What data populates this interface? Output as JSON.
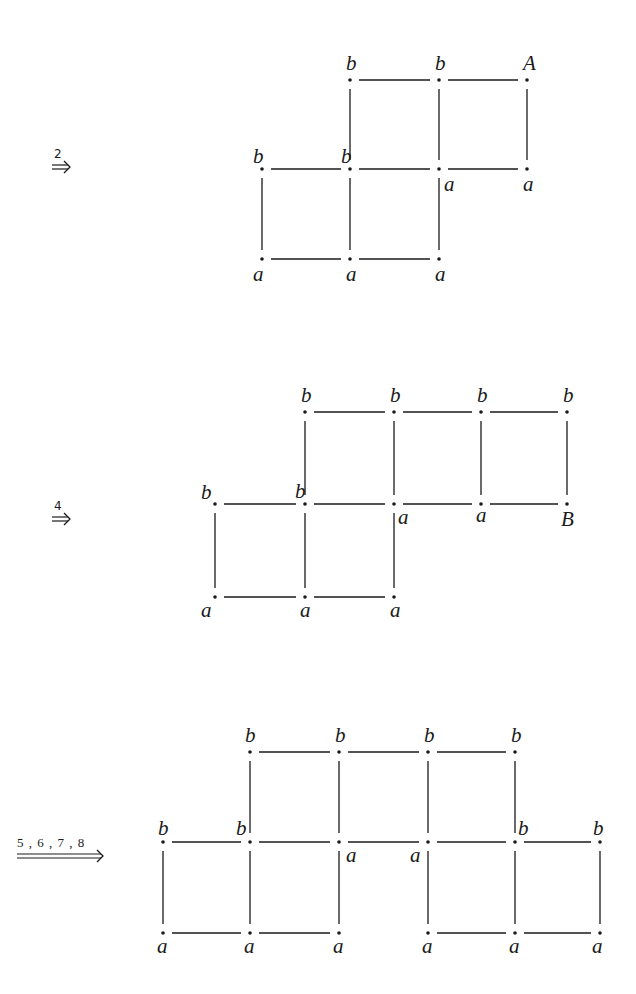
{
  "figures": [
    {
      "id": "step-2",
      "arrow": {
        "label": "2",
        "type": "double",
        "x": 52,
        "y": 167,
        "len": 18
      },
      "nodes": [
        {
          "id": "n1",
          "x": 350,
          "y": 80,
          "label": "b",
          "lx": -4,
          "ly": -10
        },
        {
          "id": "n2",
          "x": 439,
          "y": 80,
          "label": "b",
          "lx": -4,
          "ly": -10
        },
        {
          "id": "n3",
          "x": 527,
          "y": 80,
          "label": "A",
          "lx": -4,
          "ly": -10
        },
        {
          "id": "n4",
          "x": 262,
          "y": 169,
          "label": "b",
          "lx": -9,
          "ly": -6
        },
        {
          "id": "n5",
          "x": 350,
          "y": 169,
          "label": "b",
          "lx": -9,
          "ly": -6
        },
        {
          "id": "n6",
          "x": 439,
          "y": 169,
          "label": "a",
          "lx": 5,
          "ly": 22
        },
        {
          "id": "n7",
          "x": 527,
          "y": 169,
          "label": "a",
          "lx": -4,
          "ly": 22
        },
        {
          "id": "n8",
          "x": 262,
          "y": 259,
          "label": "a",
          "lx": -9,
          "ly": 22
        },
        {
          "id": "n9",
          "x": 350,
          "y": 259,
          "label": "a",
          "lx": -4,
          "ly": 22
        },
        {
          "id": "n10",
          "x": 439,
          "y": 259,
          "label": "a",
          "lx": -4,
          "ly": 22
        }
      ],
      "edges": [
        [
          "n1",
          "n2"
        ],
        [
          "n2",
          "n3"
        ],
        [
          "n1",
          "n5"
        ],
        [
          "n2",
          "n6"
        ],
        [
          "n3",
          "n7"
        ],
        [
          "n4",
          "n5"
        ],
        [
          "n5",
          "n6"
        ],
        [
          "n6",
          "n7"
        ],
        [
          "n4",
          "n8"
        ],
        [
          "n5",
          "n9"
        ],
        [
          "n6",
          "n10"
        ],
        [
          "n8",
          "n9"
        ],
        [
          "n9",
          "n10"
        ]
      ]
    },
    {
      "id": "step-4",
      "arrow": {
        "label": "4",
        "type": "double",
        "x": 52,
        "y": 519,
        "len": 18
      },
      "nodes": [
        {
          "id": "m1",
          "x": 305,
          "y": 412,
          "label": "b",
          "lx": -4,
          "ly": -10
        },
        {
          "id": "m2",
          "x": 394,
          "y": 412,
          "label": "b",
          "lx": -4,
          "ly": -10
        },
        {
          "id": "m3",
          "x": 481,
          "y": 412,
          "label": "b",
          "lx": -4,
          "ly": -10
        },
        {
          "id": "m4",
          "x": 567,
          "y": 412,
          "label": "b",
          "lx": -4,
          "ly": -10
        },
        {
          "id": "m5",
          "x": 215,
          "y": 504,
          "label": "b",
          "lx": -14,
          "ly": -5
        },
        {
          "id": "m6",
          "x": 305,
          "y": 504,
          "label": "b",
          "lx": -10,
          "ly": -6
        },
        {
          "id": "m7",
          "x": 394,
          "y": 504,
          "label": "a",
          "lx": 4,
          "ly": 20
        },
        {
          "id": "m8",
          "x": 481,
          "y": 504,
          "label": "a",
          "lx": -5,
          "ly": 18
        },
        {
          "id": "m9",
          "x": 567,
          "y": 504,
          "label": "B",
          "lx": -6,
          "ly": 22
        },
        {
          "id": "m10",
          "x": 215,
          "y": 597,
          "label": "a",
          "lx": -14,
          "ly": 20
        },
        {
          "id": "m11",
          "x": 305,
          "y": 597,
          "label": "a",
          "lx": -5,
          "ly": 20
        },
        {
          "id": "m12",
          "x": 394,
          "y": 597,
          "label": "a",
          "lx": -4,
          "ly": 20
        }
      ],
      "edges": [
        [
          "m1",
          "m2"
        ],
        [
          "m2",
          "m3"
        ],
        [
          "m3",
          "m4"
        ],
        [
          "m1",
          "m6"
        ],
        [
          "m2",
          "m7"
        ],
        [
          "m3",
          "m8"
        ],
        [
          "m4",
          "m9"
        ],
        [
          "m5",
          "m6"
        ],
        [
          "m6",
          "m7"
        ],
        [
          "m7",
          "m8"
        ],
        [
          "m8",
          "m9"
        ],
        [
          "m5",
          "m10"
        ],
        [
          "m6",
          "m11"
        ],
        [
          "m7",
          "m12"
        ],
        [
          "m10",
          "m11"
        ],
        [
          "m11",
          "m12"
        ]
      ]
    },
    {
      "id": "step-5678",
      "arrow": {
        "label": "5 , 6 , 7 , 8",
        "type": "long-double",
        "x": 17,
        "y": 856,
        "len": 86
      },
      "nodes": [
        {
          "id": "p1",
          "x": 250,
          "y": 752,
          "label": "b",
          "lx": -5,
          "ly": -10
        },
        {
          "id": "p2",
          "x": 339,
          "y": 752,
          "label": "b",
          "lx": -4,
          "ly": -10
        },
        {
          "id": "p3",
          "x": 428,
          "y": 752,
          "label": "b",
          "lx": -4,
          "ly": -10
        },
        {
          "id": "p4",
          "x": 515,
          "y": 752,
          "label": "b",
          "lx": -4,
          "ly": -10
        },
        {
          "id": "p5",
          "x": 163,
          "y": 842,
          "label": "b",
          "lx": -5,
          "ly": -7
        },
        {
          "id": "p6",
          "x": 250,
          "y": 842,
          "label": "b",
          "lx": -14,
          "ly": -7
        },
        {
          "id": "p7",
          "x": 339,
          "y": 842,
          "label": "a",
          "lx": 7,
          "ly": 20
        },
        {
          "id": "p8",
          "x": 428,
          "y": 842,
          "label": "a",
          "lx": -18,
          "ly": 20
        },
        {
          "id": "p9",
          "x": 515,
          "y": 842,
          "label": "b",
          "lx": 3,
          "ly": -7
        },
        {
          "id": "p10",
          "x": 600,
          "y": 842,
          "label": "b",
          "lx": -7,
          "ly": -7
        },
        {
          "id": "p11",
          "x": 163,
          "y": 933,
          "label": "a",
          "lx": -6,
          "ly": 20
        },
        {
          "id": "p12",
          "x": 250,
          "y": 933,
          "label": "a",
          "lx": -6,
          "ly": 20
        },
        {
          "id": "p13",
          "x": 339,
          "y": 933,
          "label": "a",
          "lx": -6,
          "ly": 20
        },
        {
          "id": "p14",
          "x": 428,
          "y": 933,
          "label": "a",
          "lx": -6,
          "ly": 20
        },
        {
          "id": "p15",
          "x": 515,
          "y": 933,
          "label": "a",
          "lx": -6,
          "ly": 20
        },
        {
          "id": "p16",
          "x": 600,
          "y": 933,
          "label": "a",
          "lx": -8,
          "ly": 20
        }
      ],
      "edges": [
        [
          "p1",
          "p2"
        ],
        [
          "p2",
          "p3"
        ],
        [
          "p3",
          "p4"
        ],
        [
          "p1",
          "p6"
        ],
        [
          "p2",
          "p7"
        ],
        [
          "p3",
          "p8"
        ],
        [
          "p4",
          "p9"
        ],
        [
          "p5",
          "p6"
        ],
        [
          "p6",
          "p7"
        ],
        [
          "p7",
          "p8"
        ],
        [
          "p8",
          "p9"
        ],
        [
          "p9",
          "p10"
        ],
        [
          "p5",
          "p11"
        ],
        [
          "p6",
          "p12"
        ],
        [
          "p7",
          "p13"
        ],
        [
          "p8",
          "p14"
        ],
        [
          "p9",
          "p15"
        ],
        [
          "p10",
          "p16"
        ],
        [
          "p11",
          "p12"
        ],
        [
          "p12",
          "p13"
        ],
        [
          "p14",
          "p15"
        ],
        [
          "p15",
          "p16"
        ]
      ]
    }
  ]
}
